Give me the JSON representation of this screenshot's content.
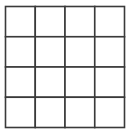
{
  "grid": {
    "rows": 4,
    "columns": 4,
    "line_color": "#3a3a3a",
    "background": "#ffffff",
    "cells_filled": false
  }
}
